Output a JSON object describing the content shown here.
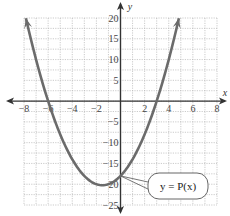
{
  "chart_data": {
    "type": "line",
    "title": "",
    "xlabel": "x",
    "ylabel": "y",
    "xlim": [
      -8,
      8
    ],
    "ylim": [
      -25,
      20
    ],
    "grid": true,
    "x_ticks": [
      -8,
      -6,
      -4,
      -2,
      2,
      4,
      6,
      8
    ],
    "y_ticks": [
      20,
      15,
      10,
      5,
      -5,
      -10,
      -15,
      -20,
      -25
    ],
    "series": [
      {
        "name": "y = P(x)",
        "function": "P(x) = (x + 6)(x - 3) = x^2 + 3x - 18",
        "roots": [
          -6,
          3
        ],
        "y_intercept": -18,
        "vertex": [
          -1.5,
          -20.25
        ],
        "x": [
          -7.84,
          -7,
          -6,
          -5,
          -4,
          -3,
          -2,
          -1.5,
          -1,
          0,
          1,
          2,
          3,
          4,
          4.84
        ],
        "values": [
          20,
          10,
          0,
          -8,
          -14,
          -18,
          -20,
          -20.25,
          -20,
          -18,
          -14,
          -8,
          0,
          10,
          20
        ],
        "arrows_at_ends": true
      }
    ],
    "annotations": [
      {
        "text": "y = P(x)",
        "type": "callout",
        "points_to": [
          0,
          -18
        ]
      }
    ],
    "legend_position": "none"
  },
  "colors": {
    "curve": "#6b6b6b",
    "axis": "#333333",
    "grid": "#b5b5b5",
    "text": "#444444"
  },
  "labels": {
    "x_axis": "x",
    "y_axis": "y",
    "callout": "y = P(x)"
  }
}
